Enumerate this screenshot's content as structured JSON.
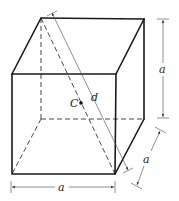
{
  "figure": {
    "type": "cube-diagram",
    "labels": {
      "center": "C",
      "diagonal": "d",
      "height": "a",
      "depth": "a",
      "width": "a"
    },
    "vertices": {
      "front_top_left": [
        12,
        74
      ],
      "front_top_right": [
        116,
        74
      ],
      "front_bottom_left": [
        12,
        174
      ],
      "front_bottom_right": [
        115,
        174
      ],
      "back_top_left": [
        41,
        18
      ],
      "back_top_right": [
        144,
        19
      ],
      "back_bottom_left": [
        41,
        119
      ],
      "back_bottom_right": [
        144,
        119
      ]
    },
    "center_point": [
      81,
      103
    ],
    "colors": {
      "line": "#1a1a1a",
      "background": "#ffffff"
    }
  }
}
